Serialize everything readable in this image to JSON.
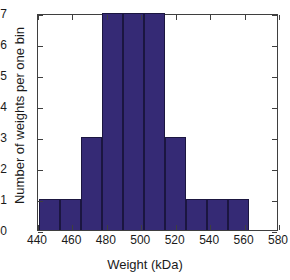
{
  "chart_data": {
    "type": "bar",
    "title": "",
    "subtitle": "",
    "xlabel": "Weight (kDa)",
    "ylabel": "Number of weights per one bin",
    "xlim": [
      440,
      580
    ],
    "ylim": [
      0,
      7
    ],
    "xticks": [
      440,
      460,
      480,
      500,
      520,
      540,
      560,
      580
    ],
    "yticks": [
      0,
      1,
      2,
      3,
      4,
      5,
      6,
      7
    ],
    "grid": false,
    "legend": null,
    "bar_color": "#352a75",
    "bar_edge_color": "#1b1640",
    "axes_color": "#3f3f3f",
    "background": "#ffffff",
    "bin_width": 12.2,
    "bin_edges": [
      440.5,
      452.7,
      464.9,
      477.1,
      489.3,
      501.5,
      513.7,
      525.9,
      538.1,
      550.3,
      562.5
    ],
    "bin_centers": [
      446.6,
      458.8,
      471.0,
      483.2,
      495.4,
      507.6,
      519.8,
      532.0,
      544.2,
      556.4
    ],
    "categories": [
      "440.5-452.7",
      "452.7-464.9",
      "464.9-477.1",
      "477.1-489.3",
      "489.3-501.5",
      "501.5-513.7",
      "513.7-525.9",
      "525.9-538.1",
      "538.1-550.3",
      "550.3-562.5"
    ],
    "values": [
      1,
      1,
      3,
      7,
      7,
      7,
      3,
      1,
      1,
      1
    ],
    "total_count": 26
  },
  "axis": {
    "x_title": "Weight (kDa)",
    "y_title": "Number of weights per one bin",
    "xtick_labels": [
      "440",
      "460",
      "480",
      "500",
      "520",
      "540",
      "560",
      "580"
    ],
    "ytick_labels": [
      "0",
      "1",
      "2",
      "3",
      "4",
      "5",
      "6",
      "7"
    ]
  }
}
